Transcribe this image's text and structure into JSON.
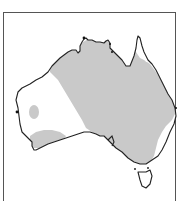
{
  "map": {
    "subject": "Australia",
    "style": "grayscale outline map with shaded region",
    "colors": {
      "background": "#ffffff",
      "shaded_region": "#c9c9c9",
      "coastline": "#222222",
      "frame": "#555555"
    },
    "regions": [
      {
        "name": "shaded-interior-north-east",
        "fill": "#c9c9c9"
      },
      {
        "name": "unshaded-west",
        "fill": "#ffffff"
      },
      {
        "name": "shaded-west-patch",
        "fill": "#c9c9c9"
      },
      {
        "name": "shaded-southwest",
        "fill": "#c9c9c9"
      },
      {
        "name": "unshaded-east-coast",
        "fill": "#ffffff"
      },
      {
        "name": "unshaded-cape-york-tip",
        "fill": "#ffffff"
      },
      {
        "name": "tasmania",
        "fill": "#ffffff"
      }
    ],
    "labels": []
  }
}
